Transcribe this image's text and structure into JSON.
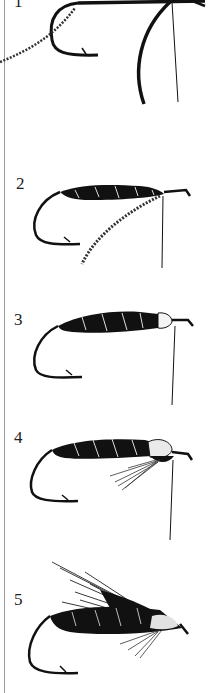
{
  "figure": {
    "steps": [
      {
        "number": "1",
        "description": "Hook with tinsel and thread tied in"
      },
      {
        "number": "2",
        "description": "Black body wound with tinsel ribbing, tinsel hanging"
      },
      {
        "number": "3",
        "description": "Ribbed black body with white head section"
      },
      {
        "number": "4",
        "description": "Body with speckled head and throat hackle fibers"
      },
      {
        "number": "5",
        "description": "Completed fly with dark wing and speckled cheek"
      }
    ],
    "colors": {
      "ink": "#111111",
      "rule": "#9a9a9a",
      "background": "#ffffff"
    }
  }
}
